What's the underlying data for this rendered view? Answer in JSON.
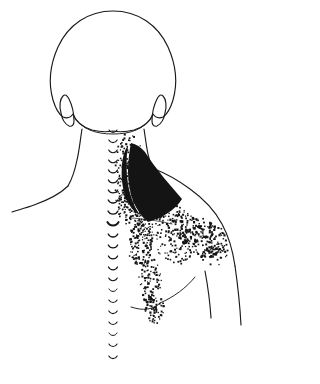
{
  "figure": {
    "view": "posterior",
    "background_color": "#ffffff",
    "ink_color": "#141414",
    "canvas": {
      "width": 279,
      "height": 384
    }
  },
  "legend": {
    "solid_region_label": "essential (primary) referred pain zone",
    "stipple_region_label": "spillover (secondary) referred pain zone",
    "solid_region_color": "#141414",
    "stipple_region_color": "#141414"
  },
  "anatomy": {
    "regions": [
      {
        "name": "head",
        "label": "Head (occiput)"
      },
      {
        "name": "ear-left",
        "label": "Left ear"
      },
      {
        "name": "ear-right",
        "label": "Right ear"
      },
      {
        "name": "neck",
        "label": "Neck"
      },
      {
        "name": "spine",
        "label": "Spinous process column"
      },
      {
        "name": "shoulder-left",
        "label": "Left shoulder"
      },
      {
        "name": "shoulder-right",
        "label": "Right shoulder"
      },
      {
        "name": "arm-right",
        "label": "Right upper arm"
      },
      {
        "name": "scapula-right",
        "label": "Right scapula"
      }
    ]
  },
  "spine": {
    "label": "Spinous process column",
    "mark_count": 22,
    "top_y": 130,
    "bottom_y": 356,
    "center_x": 113,
    "emphasized_index": 9,
    "marks": [
      {
        "y": 130,
        "w": 8.0,
        "sw": 1.1
      },
      {
        "y": 140,
        "w": 8.4,
        "sw": 1.1
      },
      {
        "y": 150,
        "w": 8.6,
        "sw": 1.15
      },
      {
        "y": 160,
        "w": 8.8,
        "sw": 1.15
      },
      {
        "y": 170,
        "w": 9.0,
        "sw": 1.2
      },
      {
        "y": 180,
        "w": 9.2,
        "sw": 1.2
      },
      {
        "y": 190,
        "w": 9.4,
        "sw": 1.25
      },
      {
        "y": 200,
        "w": 9.6,
        "sw": 1.3
      },
      {
        "y": 211,
        "w": 10.0,
        "sw": 1.35
      },
      {
        "y": 222,
        "w": 11.2,
        "sw": 1.9
      },
      {
        "y": 234,
        "w": 9.6,
        "sw": 1.3
      },
      {
        "y": 245,
        "w": 9.4,
        "sw": 1.25
      },
      {
        "y": 256,
        "w": 9.2,
        "sw": 1.2
      },
      {
        "y": 267,
        "w": 9.0,
        "sw": 1.2
      },
      {
        "y": 278,
        "w": 8.6,
        "sw": 1.1
      },
      {
        "y": 289,
        "w": 8.0,
        "sw": 1.0
      },
      {
        "y": 300,
        "w": 8.2,
        "sw": 1.05
      },
      {
        "y": 311,
        "w": 8.4,
        "sw": 1.1
      },
      {
        "y": 322,
        "w": 8.2,
        "sw": 1.05
      },
      {
        "y": 333,
        "w": 8.0,
        "sw": 1.0
      },
      {
        "y": 344,
        "w": 8.2,
        "sw": 1.05
      },
      {
        "y": 356,
        "w": 8.4,
        "sw": 1.1
      }
    ]
  },
  "outlines": {
    "head": "M 113 11 C 88 11 68 25 58 47 C 49 67 49 86 53 100 C 56 110 60 115 63 117 C 68 119 71 117 73 114 C 76 122 82 127 92 130 C 100 132 108 132 113 131 C 118 132 126 132 134 130 C 144 127 150 122 153 114 C 155 117 158 119 163 117 C 166 115 170 110 173 100 C 177 86 177 67 168 47 C 158 25 138 11 113 11 Z",
    "hairline": "M 74 117 C 82 129 95 134 113 134 C 131 134 144 129 152 117",
    "ear_left": "M 63 96 C 60 99 59 106 61 113 C 62 119 65 124 69 126 C 72 127 74 125 74 121 C 74 114 72 105 69 99 C 67 95 65 94 63 96 Z",
    "ear_right": "M 163 96 C 166 99 167 106 165 113 C 164 119 161 124 157 126 C 154 127 152 125 152 121 C 152 114 154 105 157 99 C 159 95 161 94 163 96 Z",
    "neck_left": "M 82 129 C 80 142 79 152 77 160 C 75 170 72 179 68 186",
    "neck_right": "M 144 129 C 146 142 147 152 149 158 C 150 162 151 165 152 168",
    "shoulder_left": "M 68 186 C 60 194 48 200 34 205 C 26 208 18 210 12 212",
    "shoulder_right": "M 152 168 C 165 173 178 180 190 189 C 204 199 215 211 222 224 C 229 237 233 252 235 266",
    "arm_right_outer": "M 235 266 C 238 287 240 306 241 325",
    "arm_right_inner": "M 205 271 C 208 287 210 302 211 318",
    "axilla_fold": "M 160 303 C 174 297 186 288 195 277",
    "latissimus_edge": "M 131 307 C 143 311 153 310 160 303",
    "scapular_spine": "M 132 218 C 146 219 160 221 172 224"
  },
  "pain_zones": {
    "solid": {
      "name": "essential-pain-zone",
      "description": "Solid black wedge over upper trapezius / cervicothoracic junction",
      "path": "M 131 143 C 129 152 128 162 128 172 C 128 182 130 192 133 201 C 137 210 142 217 148 222 C 155 220 162 217 168 213 C 174 209 179 204 182 199 C 176 192 170 185 164 178 C 157 169 150 160 145 152 C 141 147 136 144 131 143 Z",
      "secondary_path": "M 128 146 C 126 158 126 172 128 184 C 130 196 134 207 140 215 C 134 212 129 206 126 198 C 122 188 121 176 122 164 C 123 155 125 149 128 146 Z"
    },
    "stipple_clusters": [
      {
        "name": "upper-trapezius-halo",
        "cx": 128,
        "cy": 160,
        "rx": 14,
        "ry": 26,
        "count": 95,
        "size_min": 1.1,
        "size_max": 2.1,
        "density_bias": 0.55
      },
      {
        "name": "cervicothoracic-cluster",
        "cx": 134,
        "cy": 205,
        "rx": 18,
        "ry": 20,
        "count": 120,
        "size_min": 1.1,
        "size_max": 2.2,
        "density_bias": 0.5
      },
      {
        "name": "supraspinous-band",
        "cx": 160,
        "cy": 213,
        "rx": 26,
        "ry": 11,
        "count": 85,
        "size_min": 1.1,
        "size_max": 2.0,
        "density_bias": 0.6
      },
      {
        "name": "scapular-field-upper",
        "cx": 186,
        "cy": 228,
        "rx": 28,
        "ry": 15,
        "count": 125,
        "size_min": 1.2,
        "size_max": 2.3,
        "density_bias": 0.6
      },
      {
        "name": "scapular-field-lateral",
        "cx": 205,
        "cy": 240,
        "rx": 22,
        "ry": 18,
        "count": 115,
        "size_min": 1.2,
        "size_max": 2.3,
        "density_bias": 0.55
      },
      {
        "name": "deltoid-posterior",
        "cx": 213,
        "cy": 252,
        "rx": 16,
        "ry": 13,
        "count": 60,
        "size_min": 1.2,
        "size_max": 2.2,
        "density_bias": 0.6
      },
      {
        "name": "medial-border-trail",
        "cx": 141,
        "cy": 245,
        "rx": 12,
        "ry": 22,
        "count": 105,
        "size_min": 1.1,
        "size_max": 2.2,
        "density_bias": 0.5
      },
      {
        "name": "medial-border-lower",
        "cx": 150,
        "cy": 280,
        "rx": 11,
        "ry": 24,
        "count": 95,
        "size_min": 1.1,
        "size_max": 2.2,
        "density_bias": 0.5
      },
      {
        "name": "inferior-angle-cluster",
        "cx": 155,
        "cy": 310,
        "rx": 11,
        "ry": 13,
        "count": 55,
        "size_min": 1.2,
        "size_max": 2.2,
        "density_bias": 0.6
      },
      {
        "name": "interscapular-scatter",
        "cx": 147,
        "cy": 232,
        "rx": 14,
        "ry": 14,
        "count": 55,
        "size_min": 1.0,
        "size_max": 1.9,
        "density_bias": 0.5
      },
      {
        "name": "infraspinous-scatter",
        "cx": 176,
        "cy": 250,
        "rx": 18,
        "ry": 14,
        "count": 55,
        "size_min": 1.1,
        "size_max": 2.0,
        "density_bias": 0.5
      },
      {
        "name": "spine-side-scatter",
        "cx": 124,
        "cy": 190,
        "rx": 8,
        "ry": 24,
        "count": 45,
        "size_min": 1.0,
        "size_max": 1.9,
        "density_bias": 0.5
      }
    ]
  }
}
